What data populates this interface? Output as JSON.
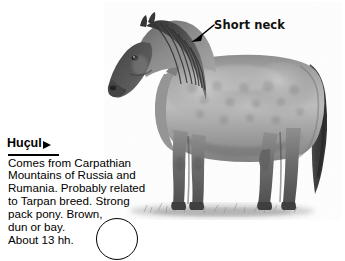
{
  "page": {
    "background_color": "#ffffff"
  },
  "photo": {
    "alt_name": "hucul-horse-photograph",
    "subject": "Huçul horse standing in profile facing left",
    "palette": {
      "mane_dark": "#3a3a3a",
      "head_dark": "#4a4a4a",
      "body_mid": "#9a9a9a",
      "body_light": "#c2c2c2",
      "highlight": "#dcdcdc",
      "leg_dark": "#5c5c5c",
      "tail_dark": "#3f3f3f",
      "ground": "#b8b8b8"
    }
  },
  "callout": {
    "label": "Short neck",
    "arrow_name": "leader-arrow",
    "arrow_color": "#000000"
  },
  "caption": {
    "title": "Huçul",
    "marker_icon": "right-triangle-icon",
    "body_lines": [
      "Comes from Carpathian",
      "Mountains of Russia and",
      "Rumania. Probably related",
      "to Tarpan breed. Strong",
      "pack pony. Brown,",
      "dun or bay.",
      "About 13 hh."
    ]
  },
  "circle_marker": {
    "name": "circle-outline",
    "stroke_color": "#000000"
  }
}
